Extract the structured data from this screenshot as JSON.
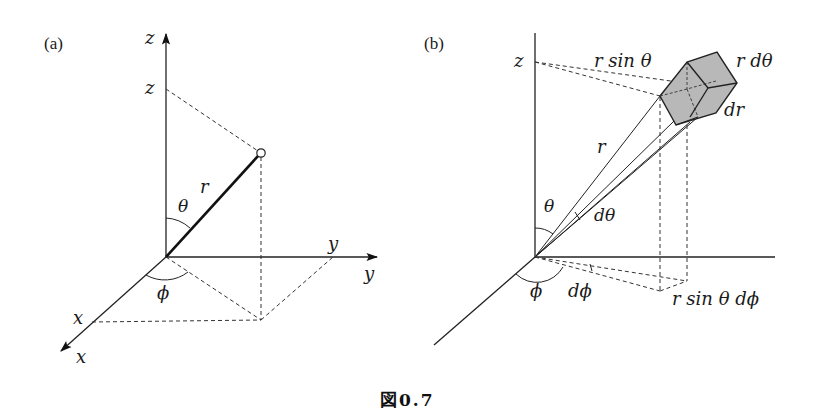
{
  "panel_a": {
    "label": "(a)",
    "z_axis_label": "z",
    "z_tick_label": "z",
    "y_axis_label": "y",
    "y_tick_label": "y",
    "x_axis_label": "x",
    "x_tick_label": "x",
    "radius_label": "r",
    "theta_label": "θ",
    "phi_label": "ϕ"
  },
  "panel_b": {
    "label": "(b)",
    "z_tick_label": "z",
    "r_sin_theta_label": "r sin θ",
    "r_dtheta_label": "r dθ",
    "dr_label": "dr",
    "radius_label": "r",
    "theta_label": "θ",
    "dtheta_label": "dθ",
    "phi_label": "ϕ",
    "dphi_label": "dϕ",
    "r_sin_theta_dphi_label": "r sin θ dϕ"
  },
  "caption": {
    "prefix": "図",
    "number": "0.7"
  },
  "colors": {
    "ink": "#222222",
    "volume_element_fill": "#b8b8b8",
    "background": "#ffffff"
  }
}
